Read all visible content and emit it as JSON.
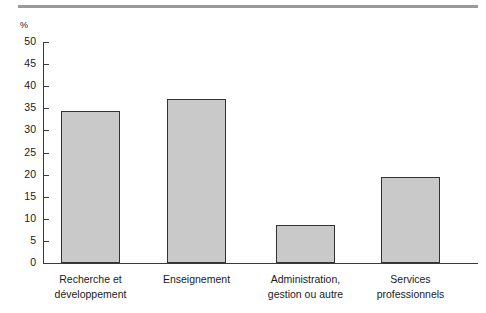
{
  "figure": {
    "top_rule_color": "#9a9a9a",
    "bar_fill_color": "#c9c9c9",
    "bar_border_color": "#333333",
    "axis_color": "#3a3a3a"
  },
  "chart_data": {
    "type": "bar",
    "title": "",
    "subtitle": "",
    "xlabel": "",
    "ylabel": "%",
    "unit_label": "%",
    "ylim": [
      0,
      50
    ],
    "ytick_step": 5,
    "yticks": [
      "50",
      "45",
      "40",
      "35",
      "30",
      "25",
      "20",
      "15",
      "10",
      "5",
      "0"
    ],
    "grid": false,
    "legend": false,
    "legend_position": "none",
    "categories": [
      "Recherche et développement",
      "Enseignement",
      "Administration, gestion ou autre",
      "Services professionnels"
    ],
    "category_lines": [
      [
        "Recherche et",
        "développement"
      ],
      [
        "Enseignement",
        ""
      ],
      [
        "Administration,",
        "gestion ou autre"
      ],
      [
        "Services",
        "professionnels"
      ]
    ],
    "values": [
      34.4,
      37.1,
      8.6,
      19.4
    ]
  }
}
